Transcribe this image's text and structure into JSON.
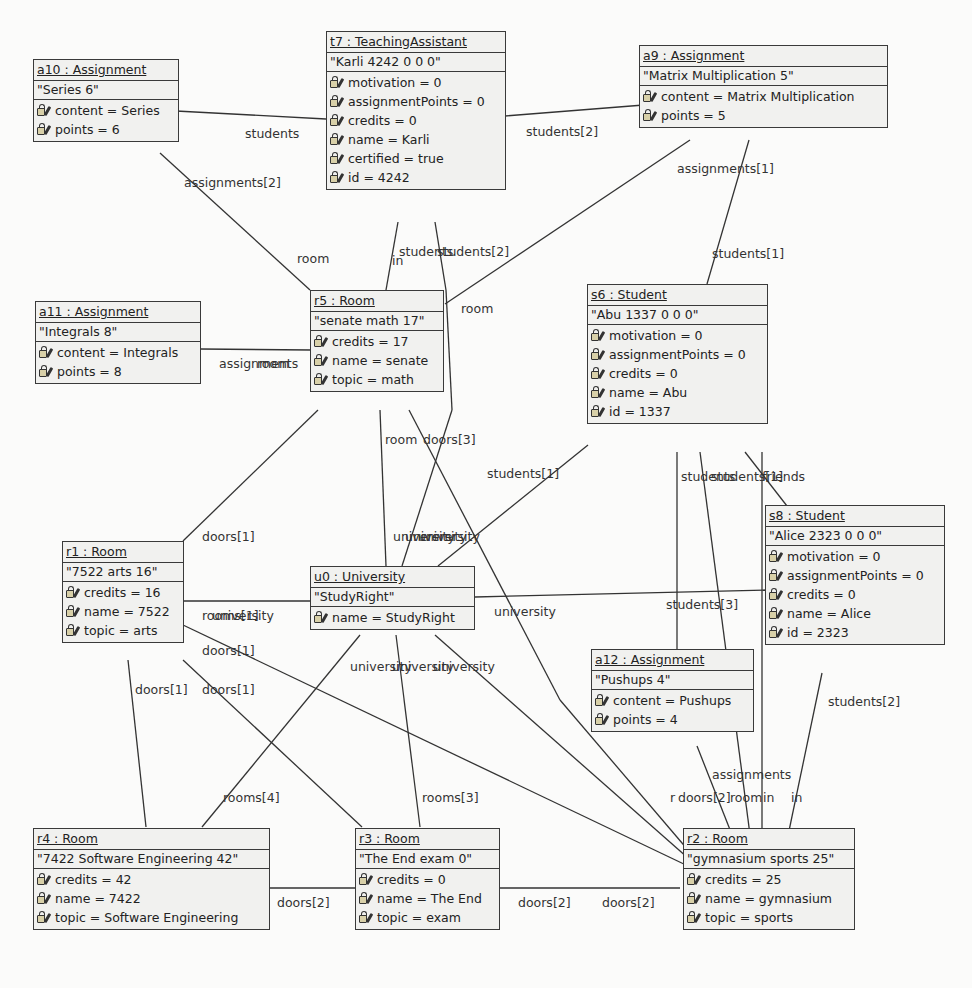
{
  "objects": {
    "a10": {
      "title": "a10 : Assignment",
      "repr": "\"Series 6\"",
      "attrs": [
        "content = Series",
        "points = 6"
      ]
    },
    "t7": {
      "title": "t7 : TeachingAssistant",
      "repr": "\"Karli 4242 0 0 0\"",
      "attrs": [
        "motivation = 0",
        "assignmentPoints = 0",
        "credits = 0",
        "name = Karli",
        "certified = true",
        "id = 4242"
      ]
    },
    "a9": {
      "title": "a9 : Assignment",
      "repr": "\"Matrix Multiplication 5\"",
      "attrs": [
        "content = Matrix Multiplication",
        "points = 5"
      ]
    },
    "a11": {
      "title": "a11 : Assignment",
      "repr": "\"Integrals 8\"",
      "attrs": [
        "content = Integrals",
        "points = 8"
      ]
    },
    "r5": {
      "title": "r5 : Room",
      "repr": "\"senate math 17\"",
      "attrs": [
        "credits = 17",
        "name = senate",
        "topic = math"
      ]
    },
    "s6": {
      "title": "s6 : Student",
      "repr": "\"Abu 1337 0 0 0\"",
      "attrs": [
        "motivation = 0",
        "assignmentPoints = 0",
        "credits = 0",
        "name = Abu",
        "id = 1337"
      ]
    },
    "s8": {
      "title": "s8 : Student",
      "repr": "\"Alice 2323 0 0 0\"",
      "attrs": [
        "motivation = 0",
        "assignmentPoints = 0",
        "credits = 0",
        "name = Alice",
        "id = 2323"
      ]
    },
    "r1": {
      "title": "r1 : Room",
      "repr": "\"7522 arts 16\"",
      "attrs": [
        "credits = 16",
        "name = 7522",
        "topic = arts"
      ]
    },
    "u0": {
      "title": "u0 : University",
      "repr": "\"StudyRight\"",
      "attrs": [
        "name = StudyRight"
      ]
    },
    "a12": {
      "title": "a12 : Assignment",
      "repr": "\"Pushups 4\"",
      "attrs": [
        "content = Pushups",
        "points = 4"
      ]
    },
    "r4": {
      "title": "r4 : Room",
      "repr": "\"7422 Software Engineering 42\"",
      "attrs": [
        "credits = 42",
        "name = 7422",
        "topic = Software Engineering"
      ]
    },
    "r3": {
      "title": "r3 : Room",
      "repr": "\"The End exam 0\"",
      "attrs": [
        "credits = 0",
        "name = The End",
        "topic = exam"
      ]
    },
    "r2": {
      "title": "r2 : Room",
      "repr": "\"gymnasium sports 25\"",
      "attrs": [
        "credits = 25",
        "name = gymnasium",
        "topic = sports"
      ]
    }
  },
  "edge_labels": [
    "students",
    "students[2]",
    "assignments[2]",
    "assignments[1]",
    "students[1]",
    "room",
    "in",
    "students",
    "students[2]",
    "room",
    "assignments",
    "room",
    "room",
    "doors[3]",
    "students[1]",
    "students",
    "students[1]",
    "friends",
    "doors[1]",
    "university",
    "university",
    "university",
    "rooms[1]",
    "university",
    "university",
    "students[3]",
    "doors[1]",
    "doors[1]",
    "doors[1]",
    "university",
    "university",
    "university",
    "students[2]",
    "rooms[4]",
    "rooms[3]",
    "assignments",
    "r",
    "doors[2]",
    "room",
    "in",
    "in",
    "doors[2]",
    "doors[2]",
    "doors[2]"
  ]
}
